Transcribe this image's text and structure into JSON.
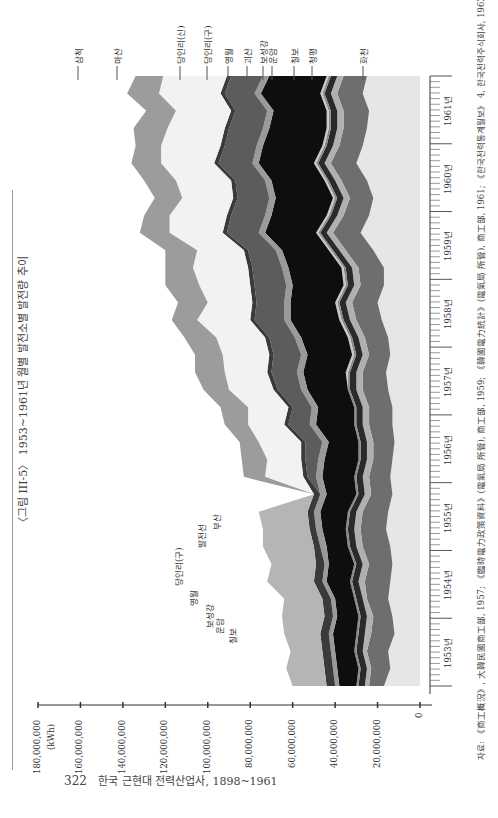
{
  "page": {
    "title": "〈그림 III-5〉 1953~1961년 월별 발전소별 발전량 추이",
    "page_number": "322",
    "book_title": "한국 근현대 전력산업사, 1898~1961",
    "source": "자료: 《商工概況》, 大韓民國商工部, 1957; 《臨時電力政策資料》(電氣局 所管), 商工部, 1959; 《韓國電力統計》(電氣局 所管), 商工部, 1961; 《한국전력통계월보》 4, 한국전력주식회사, 1962."
  },
  "chart_data": {
    "type": "area",
    "stacked": true,
    "orientation": "rotated-90-ccw",
    "title": "1953~1961년 월별 발전소별 발전량 추이",
    "xlabel": "연월 (1953~1961, 월별)",
    "ylabel": "(kWh)",
    "ylim": [
      0,
      180000000
    ],
    "y_ticks": [
      "0",
      "20,000,000",
      "40,000,000",
      "60,000,000",
      "80,000,000",
      "100,000,000",
      "120,000,000",
      "140,000,000",
      "160,000,000",
      "180,000,000"
    ],
    "year_labels": [
      "1953년",
      "1954년",
      "1955년",
      "1956년",
      "1957년",
      "1958년",
      "1959년",
      "1960년",
      "1961년"
    ],
    "grid": false,
    "legend_position": "inline-leader-lines",
    "annotations_left_group": [
      "당인리(구)",
      "영월",
      "보성강",
      "운암",
      "칠보"
    ],
    "annotations_middle_group": [
      "발전선",
      "부산"
    ],
    "annotations_top_group": [
      "삼척",
      "마산",
      "당인리(신)",
      "당인리(구)",
      "영월",
      "괴산",
      "보성강",
      "운암",
      "칠보",
      "청평",
      "화천"
    ],
    "x_quarterly": [
      "1953Q1",
      "1953Q2",
      "1953Q3",
      "1953Q4",
      "1954Q1",
      "1954Q2",
      "1954Q3",
      "1954Q4",
      "1955Q1",
      "1955Q2",
      "1955Q3",
      "1955Q4",
      "1956Q1",
      "1956Q2",
      "1956Q3",
      "1956Q4",
      "1957Q1",
      "1957Q2",
      "1957Q3",
      "1957Q4",
      "1958Q1",
      "1958Q2",
      "1958Q3",
      "1958Q4",
      "1959Q1",
      "1959Q2",
      "1959Q3",
      "1959Q4",
      "1960Q1",
      "1960Q2",
      "1960Q3",
      "1960Q4",
      "1961Q1",
      "1961Q2",
      "1961Q3",
      "1961Q4"
    ],
    "series": [
      {
        "name": "화천",
        "color": "#e6e6e6",
        "values": [
          17,
          14,
          15,
          12,
          13,
          15,
          14,
          13,
          14,
          16,
          15,
          13,
          14,
          13,
          12,
          13,
          13,
          15,
          16,
          14,
          15,
          18,
          20,
          17,
          17,
          22,
          28,
          24,
          22,
          25,
          30,
          27,
          25,
          24,
          27,
          25
        ]
      },
      {
        "name": "청평",
        "color": "#6e6e6e",
        "values": [
          7,
          9,
          10,
          11,
          9,
          10,
          12,
          11,
          13,
          12,
          12,
          10,
          10,
          9,
          10,
          11,
          11,
          12,
          11,
          10,
          11,
          12,
          12,
          11,
          12,
          13,
          13,
          12,
          11,
          12,
          12,
          11,
          11,
          12,
          12,
          11
        ]
      },
      {
        "name": "칠보",
        "color": "#b0b0b0",
        "values": [
          2,
          2,
          2,
          3,
          3,
          2,
          3,
          3,
          3,
          3,
          3,
          3,
          3,
          3,
          3,
          3,
          3,
          3,
          3,
          3,
          3,
          3,
          3,
          3,
          3,
          3,
          3,
          3,
          3,
          3,
          3,
          3,
          3,
          3,
          3,
          3
        ]
      },
      {
        "name": "운암",
        "color": "#2a2a2a",
        "values": [
          3,
          3,
          3,
          3,
          3,
          3,
          3,
          3,
          3,
          3,
          3,
          3,
          3,
          3,
          3,
          3,
          3,
          3,
          3,
          3,
          3,
          3,
          3,
          3,
          3,
          3,
          3,
          3,
          3,
          3,
          3,
          3,
          3,
          3,
          3,
          3
        ]
      },
      {
        "name": "보성강",
        "color": "#8a8a8a",
        "values": [
          1,
          1,
          1,
          1,
          1,
          1,
          1,
          1,
          1,
          1,
          1,
          1,
          1,
          1,
          1,
          1,
          1,
          1,
          1,
          1,
          1,
          1,
          1,
          1,
          1,
          1,
          1,
          1,
          1,
          1,
          1,
          1,
          1,
          1,
          1,
          1
        ]
      },
      {
        "name": "괴산",
        "color": "#c8c8c8",
        "values": [
          0,
          0,
          0,
          0,
          0,
          0,
          0,
          0,
          0,
          0,
          0,
          0,
          0,
          0,
          0,
          0,
          0,
          0,
          1,
          1,
          1,
          1,
          1,
          1,
          1,
          1,
          1,
          1,
          1,
          1,
          1,
          1,
          1,
          1,
          1,
          1
        ]
      },
      {
        "name": "영월",
        "color": "#0e0e0e",
        "values": [
          8,
          10,
          9,
          11,
          10,
          9,
          11,
          12,
          10,
          11,
          13,
          14,
          15,
          16,
          14,
          18,
          17,
          19,
          20,
          21,
          22,
          23,
          21,
          24,
          25,
          22,
          24,
          26,
          27,
          25,
          26,
          28,
          27,
          25,
          28,
          27
        ]
      },
      {
        "name": "당인리(구)",
        "color": "#9a9a9a",
        "values": [
          2,
          2,
          2,
          2,
          2,
          2,
          2,
          2,
          3,
          3,
          3,
          3,
          3,
          3,
          3,
          3,
          3,
          3,
          3,
          3,
          3,
          3,
          3,
          3,
          3,
          3,
          3,
          3,
          3,
          3,
          3,
          3,
          3,
          3,
          3,
          3
        ]
      },
      {
        "name": "당인리(신)",
        "color": "#5c5c5c",
        "values": [
          0,
          0,
          0,
          0,
          0,
          0,
          0,
          0,
          0,
          0,
          0,
          0,
          4,
          6,
          8,
          10,
          9,
          11,
          12,
          13,
          12,
          14,
          13,
          15,
          14,
          13,
          15,
          16,
          15,
          14,
          16,
          15,
          16,
          15,
          14,
          15
        ]
      },
      {
        "name": "부산",
        "color": "#3a3a3a",
        "values": [
          4,
          4,
          4,
          4,
          4,
          4,
          4,
          4,
          3,
          3,
          3,
          3,
          2,
          2,
          2,
          2,
          2,
          2,
          2,
          2,
          2,
          2,
          2,
          2,
          2,
          2,
          2,
          2,
          2,
          2,
          2,
          2,
          2,
          2,
          2,
          2
        ]
      },
      {
        "name": "발전선",
        "color": "#b5b5b5",
        "values": [
          16,
          18,
          15,
          17,
          20,
          18,
          22,
          21,
          24,
          22,
          23,
          0,
          0,
          0,
          0,
          0,
          0,
          0,
          0,
          0,
          0,
          0,
          0,
          0,
          0,
          0,
          0,
          0,
          0,
          0,
          0,
          0,
          0,
          0,
          0,
          0
        ]
      },
      {
        "name": "마산",
        "color": "#f2f2f2",
        "values": [
          0,
          0,
          0,
          0,
          0,
          0,
          0,
          0,
          0,
          0,
          0,
          0,
          18,
          16,
          20,
          17,
          19,
          21,
          20,
          22,
          23,
          25,
          21,
          24,
          26,
          22,
          25,
          27,
          24,
          26,
          25,
          28,
          27,
          26,
          29,
          30
        ]
      },
      {
        "name": "삼척",
        "color": "#9c9c9c",
        "values": [
          0,
          0,
          0,
          0,
          0,
          0,
          0,
          0,
          0,
          0,
          0,
          0,
          10,
          12,
          9,
          11,
          13,
          12,
          14,
          13,
          15,
          12,
          14,
          16,
          13,
          15,
          14,
          12,
          13,
          15,
          14,
          12,
          16,
          14,
          15,
          13
        ]
      }
    ],
    "unit_note": "values in millions of kWh (approximate, read from rotated stacked area chart)"
  }
}
